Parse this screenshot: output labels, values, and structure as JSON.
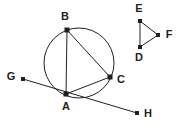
{
  "figure": {
    "background_color": "#ffffff",
    "stroke_color": "#231f20",
    "label_color": "#231f20",
    "canvas": {
      "width": 185,
      "height": 132
    }
  },
  "circle": {
    "name": "main-circle",
    "center_x": 79,
    "center_y": 63,
    "radius": 35,
    "stroke_color": "#231f20",
    "stroke_width": 1
  },
  "points": {
    "A": {
      "label": "A",
      "x": 66,
      "y": 94,
      "label_x": 66,
      "label_y": 107
    },
    "B": {
      "label": "B",
      "x": 67,
      "y": 30,
      "label_x": 65,
      "label_y": 17
    },
    "C": {
      "label": "C",
      "x": 110,
      "y": 77,
      "label_x": 121,
      "label_y": 80
    },
    "D": {
      "label": "D",
      "x": 140,
      "y": 47,
      "label_x": 139,
      "label_y": 58
    },
    "E": {
      "label": "E",
      "x": 140,
      "y": 21,
      "label_x": 139,
      "label_y": 9
    },
    "F": {
      "label": "F",
      "x": 158,
      "y": 35,
      "label_x": 169,
      "label_y": 35
    },
    "G": {
      "label": "G",
      "x": 23,
      "y": 79,
      "label_x": 11,
      "label_y": 77
    },
    "H": {
      "label": "H",
      "x": 137,
      "y": 113,
      "label_x": 148,
      "label_y": 114
    }
  },
  "segments": [
    {
      "name": "segment-AB",
      "from": "A",
      "to": "B"
    },
    {
      "name": "segment-BC",
      "from": "B",
      "to": "C"
    },
    {
      "name": "segment-AC",
      "from": "A",
      "to": "C"
    },
    {
      "name": "segment-GH",
      "from": "G",
      "to": "H"
    },
    {
      "name": "segment-DE",
      "from": "D",
      "to": "E"
    },
    {
      "name": "segment-EF",
      "from": "E",
      "to": "F"
    },
    {
      "name": "segment-DF",
      "from": "D",
      "to": "F"
    }
  ],
  "labels": {
    "A": "A",
    "B": "B",
    "C": "C",
    "D": "D",
    "E": "E",
    "F": "F",
    "G": "G",
    "H": "H"
  }
}
